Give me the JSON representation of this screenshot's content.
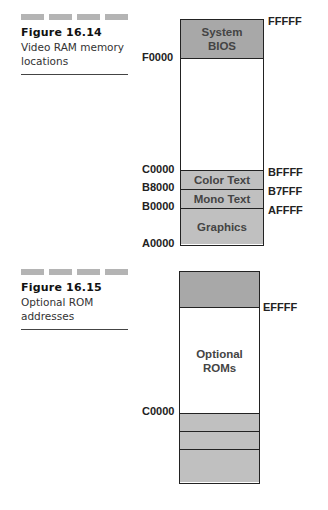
{
  "figures": [
    {
      "number": "Figure 16.14",
      "caption_line1": "Video RAM memory",
      "caption_line2": "locations",
      "segments": [
        {
          "label_line1": "System",
          "label_line2": "BIOS"
        },
        {
          "label_line1": ""
        },
        {
          "label_line1": "Color Text"
        },
        {
          "label_line1": "Mono Text"
        },
        {
          "label_line1": "Graphics"
        }
      ],
      "left_addresses": [
        "F0000",
        "C0000",
        "B8000",
        "B0000",
        "A0000"
      ],
      "right_addresses": [
        "FFFFF",
        "BFFFF",
        "B7FFF",
        "AFFFF"
      ]
    },
    {
      "number": "Figure 16.15",
      "caption_line1": "Optional ROM",
      "caption_line2": "addresses",
      "segments": [
        {
          "label_line1": ""
        },
        {
          "label_line1": "Optional",
          "label_line2": "ROMs"
        },
        {
          "label_line1": ""
        },
        {
          "label_line1": ""
        },
        {
          "label_line1": ""
        }
      ],
      "left_addresses": [
        "C0000"
      ],
      "right_addresses": [
        "EFFFF"
      ]
    }
  ]
}
